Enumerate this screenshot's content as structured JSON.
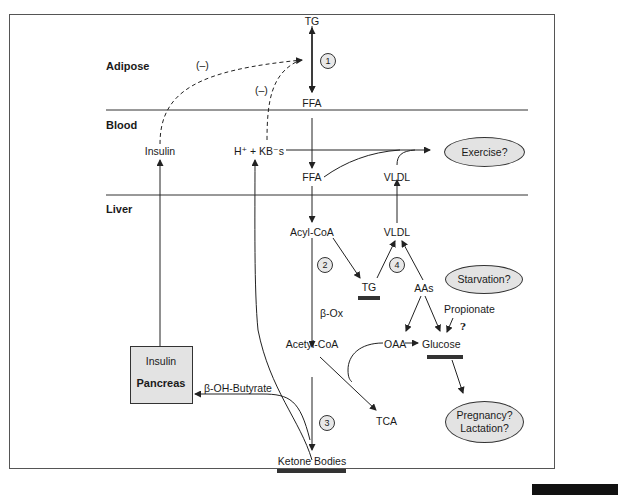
{
  "diagram": {
    "regions": {
      "adipose": "Adipose",
      "blood": "Blood",
      "liver": "Liver"
    },
    "nodes": {
      "tg_adipose": "TG",
      "ffa_adipose": "FFA",
      "ffa_blood": "FFA",
      "insulin_blood": "Insulin",
      "h_kb": "H⁺ + KB⁻s",
      "vldl_blood": "VLDL",
      "acyl_coa": "Acyl-CoA",
      "vldl_liver": "VLDL",
      "tg_liver": "TG",
      "aas": "AAs",
      "beta_ox": "β-Ox",
      "propionate": "Propionate",
      "question": "?",
      "acetyl_coa": "Acetyl-CoA",
      "oaa": "OAA",
      "glucose": "Glucose",
      "tca": "TCA",
      "ketone_bodies": "Ketone Bodies",
      "beta_oh_butyrate": "β-OH-Butyrate"
    },
    "inhibition_labels": {
      "insulin_effect": "(–)",
      "kb_effect": "(–)"
    },
    "steps": [
      "1",
      "2",
      "3",
      "4"
    ],
    "pancreas_box": {
      "hormone": "Insulin",
      "organ": "Pancreas"
    },
    "ellipses": {
      "exercise": "Exercise?",
      "starvation": "Starvation?",
      "pregnancy": "Pregnancy?",
      "lactation": "Lactation?"
    },
    "colors": {
      "line": "#333333",
      "ellipse_fill": "#e3e3e3",
      "highlight_bar": "#333333"
    }
  }
}
